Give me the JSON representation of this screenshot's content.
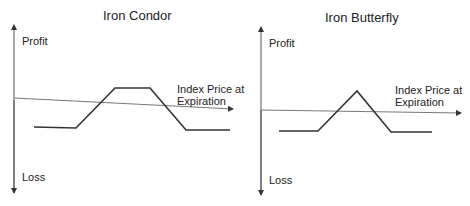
{
  "diagrams": [
    {
      "title": "Iron Condor",
      "y_axis_top_label": "Profit",
      "y_axis_bottom_label": "Loss",
      "x_axis_label_line1": "Index Price at",
      "x_axis_label_line2": "Expiration",
      "payoff_shape": "trapezoid"
    },
    {
      "title": "Iron Butterfly",
      "y_axis_top_label": "Profit",
      "y_axis_bottom_label": "Loss",
      "x_axis_label_line1": "Index Price at",
      "x_axis_label_line2": "Expiration",
      "payoff_shape": "triangle"
    }
  ],
  "colors": {
    "line": "#333333",
    "axis": "#555555",
    "background": "#ffffff"
  }
}
